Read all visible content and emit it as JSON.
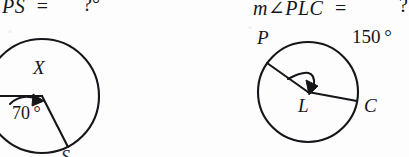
{
  "page": {
    "width": 409,
    "height": 157,
    "background_color": "#fdfdfd",
    "ink_color": "#16161a"
  },
  "problems": [
    {
      "id": "left",
      "equation": {
        "measure_prefix": "",
        "arc_name": "PS",
        "equals": "=",
        "answer": "?",
        "answer_unit": "°",
        "answer_clipped": true
      },
      "figure": {
        "type": "circle-with-central-angle",
        "circle": {
          "cx": 42,
          "cy": 96,
          "r": 57,
          "clipped_left": true,
          "clipped_bottom": true
        },
        "interior_label": "X",
        "angle_label": "70",
        "angle_unit": "°",
        "angle_value_deg": 70,
        "arrow": "curved-arc-arrow",
        "vertex_label": "",
        "point_labels": [
          "S"
        ],
        "radius_start_deg": 180,
        "radius_end_deg": 250
      }
    },
    {
      "id": "right",
      "equation": {
        "measure_prefix": "m",
        "angle_symbol": "∠",
        "angle_name": "PLC",
        "equals": "=",
        "answer": "?",
        "answer_unit": "",
        "answer_clipped": true
      },
      "figure": {
        "type": "circle-with-central-angle",
        "circle": {
          "cx": 308,
          "cy": 92,
          "r": 50
        },
        "center_label": "L",
        "point_labels": [
          "P",
          "C"
        ],
        "angle_label": "150",
        "angle_unit": "°",
        "angle_value_deg": 150,
        "arrow": "curved-arc-arrow",
        "radius_p_deg": 215,
        "radius_c_deg": 15
      }
    }
  ],
  "text": {
    "left_equation_lhs": "PS",
    "left_equation_eq": "=",
    "left_equation_answer": "?°",
    "right_equation_lhs": "m∠PLC",
    "right_equation_eq": "=",
    "right_equation_answer": "?",
    "label_x": "X",
    "label_70": "70 °",
    "label_s": "S",
    "label_p": "P",
    "label_l": "L",
    "label_c": "C",
    "label_150": "150 °"
  }
}
